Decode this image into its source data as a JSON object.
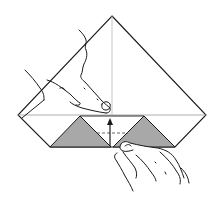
{
  "figure": {
    "type": "origami-instruction-step",
    "description": "Origami step: one hand holds the paper at the centre while the other folds the bottom edge up along the dashed line",
    "colors": {
      "background": "#ffffff",
      "paper": "#ffffff",
      "outline": "#1a1a1a",
      "crease": "#9a9a9a",
      "shaded_flap": "#a8a8a8"
    },
    "shape": {
      "apex": [
        112,
        16
      ],
      "left": [
        18,
        115
      ],
      "right": [
        206,
        115
      ],
      "bottom_left": [
        50,
        147
      ],
      "bottom_right": [
        175,
        147
      ],
      "center_bottom": [
        111,
        147
      ]
    },
    "flaps": [
      {
        "name": "left-shaded-triangle",
        "points": [
          [
            50,
            147
          ],
          [
            80,
            116
          ],
          [
            111,
            147
          ]
        ]
      },
      {
        "name": "right-shaded-triangle",
        "points": [
          [
            113,
            147
          ],
          [
            144,
            116
          ],
          [
            175,
            147
          ]
        ]
      }
    ],
    "lines": {
      "horizontal_crease_y": 115,
      "vertical_crease_x": 112,
      "dashed_fold_y": 133
    },
    "arrow": {
      "direction": "up",
      "from": [
        110,
        146
      ],
      "to": [
        110,
        120
      ],
      "label": "fold-up-arrow"
    },
    "hands": [
      {
        "name": "left-hand",
        "role": "holding paper at centre with index finger"
      },
      {
        "name": "right-hand",
        "role": "lifting bottom edge to fold up"
      }
    ]
  }
}
